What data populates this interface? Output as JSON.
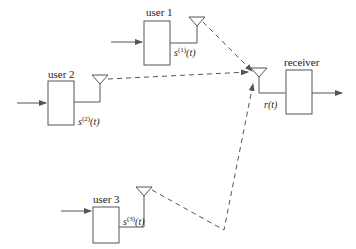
{
  "diagram": {
    "users": [
      {
        "label": "user 1",
        "signal_base": "s",
        "signal_sup": "(1)",
        "signal_arg": "(t)"
      },
      {
        "label": "user 2",
        "signal_base": "s",
        "signal_sup": "(2)",
        "signal_arg": "(t)"
      },
      {
        "label": "user 3",
        "signal_base": "s",
        "signal_sup": "(3)",
        "signal_arg": "(t)"
      }
    ],
    "receiver": {
      "label": "receiver",
      "signal": "r(t)"
    },
    "colors": {
      "line": "#555555",
      "box_fill": "#ffffff",
      "text": "#222222"
    }
  }
}
